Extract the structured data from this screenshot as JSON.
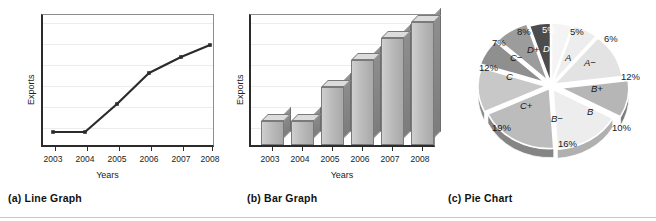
{
  "figure": {
    "bottom_rule": true
  },
  "panels": [
    {
      "id": "line",
      "caption": "(a) Line Graph",
      "xlabel": "Years",
      "ylabel": "Exports"
    },
    {
      "id": "bar",
      "caption": "(b) Bar Graph",
      "xlabel": "Years",
      "ylabel": "Exports"
    },
    {
      "id": "pie",
      "caption": "(c) Pie Chart",
      "xlabel": "",
      "ylabel": ""
    }
  ],
  "chart_data": [
    {
      "type": "line",
      "title": "(a) Line Graph",
      "xlabel": "Years",
      "ylabel": "Exports",
      "categories": [
        "2003",
        "2004",
        "2005",
        "2006",
        "2007",
        "2008"
      ],
      "values": [
        12,
        12,
        42,
        64,
        78,
        90
      ],
      "ylim": [
        0,
        100
      ],
      "grid": true,
      "legend": "none",
      "marker": "square",
      "line_color": "#2b2b2b",
      "note": "y-axis unlabeled (no numeric ticks shown); values estimated from gridline positions"
    },
    {
      "type": "bar",
      "title": "(b) Bar Graph",
      "xlabel": "Years",
      "ylabel": "Exports",
      "categories": [
        "2003",
        "2004",
        "2005",
        "2006",
        "2007",
        "2008"
      ],
      "values": [
        17,
        17,
        43,
        63,
        80,
        92
      ],
      "ylim": [
        0,
        100
      ],
      "grid": true,
      "legend": "none",
      "bar_style": "3d",
      "bar_fill": "#bdbdbd",
      "bar_side": "#838383",
      "bar_top": "#dcdcdc",
      "note": "y-axis unlabeled (no numeric ticks shown); values estimated from gridline positions"
    },
    {
      "type": "pie",
      "title": "(c) Pie Chart",
      "xlabel": "",
      "ylabel": "",
      "style": "exploded-3d",
      "labels": [
        "A",
        "A−",
        "B+",
        "B",
        "B−",
        "C+",
        "C",
        "C−",
        "D+",
        "D"
      ],
      "values": [
        5,
        6,
        12,
        10,
        16,
        19,
        12,
        7,
        8,
        5
      ],
      "value_labels": [
        "5%",
        "6%",
        "12%",
        "10%",
        "16%",
        "19%",
        "12%",
        "7%",
        "8%",
        "5%"
      ],
      "colors": [
        "#f2f2f2",
        "#eaeaea",
        "#e0e0e0",
        "#b4b4b4",
        "#ededed",
        "#b9b9b9",
        "#c6c6c6",
        "#8d8d8d",
        "#9a9a9a",
        "#4a4a4a"
      ],
      "total": 100,
      "legend": "none",
      "note": "Grade distribution; slices labeled with percentage and grade letter"
    }
  ],
  "pie_render": {
    "slices": [
      {
        "grade": "A",
        "pct": "5%",
        "fill": "#f4f4f4",
        "side": "#b8b8b8",
        "start": -90,
        "sweep": 18,
        "explode": 3,
        "grade_x": 565,
        "grade_y": 52,
        "pct_x": 570,
        "pct_y": 26,
        "dark": false
      },
      {
        "grade": "A−",
        "pct": "6%",
        "fill": "#ededed",
        "side": "#b0b0b0",
        "start": -72,
        "sweep": 21.6,
        "explode": 4,
        "grade_x": 584,
        "grade_y": 57,
        "pct_x": 604,
        "pct_y": 33,
        "dark": false
      },
      {
        "grade": "B+",
        "pct": "12%",
        "fill": "#e3e3e3",
        "side": "#a6a6a6",
        "start": -50.4,
        "sweep": 43.2,
        "explode": 4,
        "grade_x": 591,
        "grade_y": 83,
        "pct_x": 621,
        "pct_y": 71,
        "dark": false
      },
      {
        "grade": "B",
        "pct": "10%",
        "fill": "#b6b6b6",
        "side": "#7d7d7d",
        "start": -7.2,
        "sweep": 36,
        "explode": 10,
        "grade_x": 587,
        "grade_y": 106,
        "pct_x": 612,
        "pct_y": 122,
        "dark": false
      },
      {
        "grade": "B−",
        "pct": "16%",
        "fill": "#ededed",
        "side": "#b0b0b0",
        "start": 28.8,
        "sweep": 57.6,
        "explode": 4,
        "grade_x": 551,
        "grade_y": 113,
        "pct_x": 558,
        "pct_y": 138,
        "dark": false
      },
      {
        "grade": "C+",
        "pct": "19%",
        "fill": "#bcbcbc",
        "side": "#858585",
        "start": 86.4,
        "sweep": 68.4,
        "explode": 3,
        "grade_x": 520,
        "grade_y": 100,
        "pct_x": 492,
        "pct_y": 122,
        "dark": false
      },
      {
        "grade": "C",
        "pct": "12%",
        "fill": "#c8c8c8",
        "side": "#8e8e8e",
        "start": 154.8,
        "sweep": 43.2,
        "explode": 5,
        "grade_x": 506,
        "grade_y": 71,
        "pct_x": 479,
        "pct_y": 62,
        "dark": false
      },
      {
        "grade": "C−",
        "pct": "7%",
        "fill": "#8f8f8f",
        "side": "#636363",
        "start": 198,
        "sweep": 25.2,
        "explode": 7,
        "grade_x": 510,
        "grade_y": 52,
        "pct_x": 492,
        "pct_y": 37,
        "dark": false
      },
      {
        "grade": "D+",
        "pct": "8%",
        "fill": "#9c9c9c",
        "side": "#6b6b6b",
        "start": 223.2,
        "sweep": 28.8,
        "explode": 6,
        "grade_x": 527,
        "grade_y": 44,
        "pct_x": 517,
        "pct_y": 26,
        "dark": false
      },
      {
        "grade": "D",
        "pct": "5%",
        "fill": "#4c4c4c",
        "side": "#313131",
        "start": 252,
        "sweep": 18,
        "explode": 3,
        "grade_x": 543,
        "grade_y": 43,
        "pct_x": 542,
        "pct_y": 24,
        "dark": true
      }
    ],
    "cx": 551,
    "cy": 86,
    "rx": 68,
    "ry": 60,
    "depth": 9
  },
  "line_render": {
    "frame": {
      "x": 41,
      "y": 14,
      "w": 173,
      "h": 133
    },
    "gridlines_y": [
      22,
      43,
      64,
      85,
      106,
      127
    ],
    "points": [
      {
        "x": 53,
        "y": 132
      },
      {
        "x": 85,
        "y": 132
      },
      {
        "x": 117,
        "y": 104
      },
      {
        "x": 149,
        "y": 73
      },
      {
        "x": 181,
        "y": 57
      },
      {
        "x": 210,
        "y": 45
      }
    ],
    "ticks_x": [
      53,
      85,
      117,
      149,
      181,
      210
    ]
  },
  "bar_render": {
    "frame": {
      "x": 249,
      "y": 14,
      "w": 186,
      "h": 133
    },
    "gridlines_y": [
      22,
      43,
      64,
      85,
      106,
      127
    ],
    "bars": [
      {
        "x": 259,
        "w": 23,
        "h": 24
      },
      {
        "x": 289,
        "w": 23,
        "h": 24
      },
      {
        "x": 319,
        "w": 23,
        "h": 58
      },
      {
        "x": 349,
        "w": 23,
        "h": 85
      },
      {
        "x": 379,
        "w": 23,
        "h": 107
      },
      {
        "x": 409,
        "w": 23,
        "h": 123
      }
    ],
    "ticks_x": [
      270,
      300,
      330,
      360,
      390,
      420
    ]
  }
}
